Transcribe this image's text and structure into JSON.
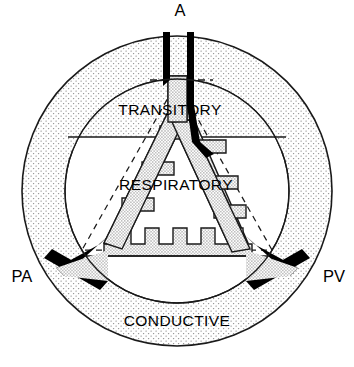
{
  "diagram": {
    "zones": [
      {
        "id": "conductive",
        "label": "CONDUCTIVE",
        "x": 177,
        "y": 322,
        "fill": "stipple-light"
      },
      {
        "id": "transitory",
        "label": "TRANSITORY",
        "x": 170,
        "y": 110,
        "fill": "stipple-light"
      },
      {
        "id": "respiratory",
        "label": "RESPIRATORY",
        "x": 176,
        "y": 185,
        "fill": "white"
      }
    ],
    "vessels": [
      {
        "id": "airway",
        "label": "A",
        "x": 180,
        "y": 12,
        "color": "#000000",
        "role": "airway"
      },
      {
        "id": "pulmonary-artery",
        "label": "PA",
        "x": 22,
        "y": 277,
        "color": "#000000",
        "role": "artery"
      },
      {
        "id": "pulmonary-vein",
        "label": "PV",
        "x": 334,
        "y": 277,
        "color": "#000000",
        "role": "vein"
      }
    ],
    "geometry": {
      "outer_circle": {
        "cx": 177,
        "cy": 191,
        "r": 155
      },
      "inner_circle": {
        "cx": 177,
        "cy": 191,
        "r": 112
      },
      "transitory_divider_y": 137,
      "alveolar_finger_count": 5,
      "side_branch_count_per_limb": 3
    },
    "colors": {
      "stroke": "#1a1a1a",
      "vessel_black": "#000000",
      "stipple_dot": "#8d8d8d",
      "acinus_fill": "#cfcfcf",
      "background": "#ffffff"
    }
  }
}
